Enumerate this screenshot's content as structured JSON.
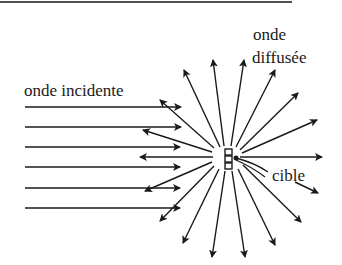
{
  "diagram": {
    "labels": {
      "incident": "onde incidente",
      "scattered_line1": "onde",
      "scattered_line2": "diffusée",
      "target": "cible"
    },
    "colors": {
      "ink": "#1a1a1a",
      "background": "#ffffff"
    },
    "center": [
      228,
      157
    ],
    "incident_rays_y": [
      107,
      127,
      147,
      167,
      188,
      208
    ],
    "scattered_ray_tips": [
      [
        184,
        70
      ],
      [
        213,
        60
      ],
      [
        244,
        60
      ],
      [
        275,
        70
      ],
      [
        298,
        93
      ],
      [
        317,
        120
      ],
      [
        322,
        157
      ],
      [
        301,
        222
      ],
      [
        275,
        245
      ],
      [
        245,
        257
      ],
      [
        212,
        257
      ],
      [
        183,
        243
      ],
      [
        160,
        221
      ],
      [
        145,
        191
      ],
      [
        140,
        157
      ],
      [
        143,
        130
      ],
      [
        160,
        100
      ]
    ]
  }
}
